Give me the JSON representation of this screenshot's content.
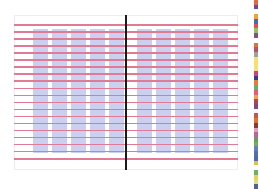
{
  "layout_grid": {
    "description": "Two-page spread layout grid with baseline rules and column guides",
    "columns_per_page": 5,
    "pages": 2,
    "baseline_rule_count": 20,
    "colors": {
      "page_background": "#ffffff",
      "page_border": "#ececf2",
      "column_guide": "#c8cdf0",
      "baseline_rule": "#e07a95",
      "spine": "#1a1a1a"
    }
  },
  "color_strip": {
    "swatches": [
      "#e06a3a",
      "#6a4aa0",
      "#ffffff",
      "#f0a040",
      "#4a6ab0",
      "#e05050",
      "#90c060",
      "#8a4a9a",
      "#ffffff",
      "#e07040",
      "#c05060",
      "#a0a0a0",
      "#f5e070",
      "#f5e070",
      "#f5e070",
      "#d04080",
      "#3a3a8a",
      "#e08030",
      "#60b070",
      "#e06070",
      "#f0a050",
      "#c04040",
      "#7a4a8a",
      "#ffffff",
      "#d05050",
      "#e07030",
      "#8a3a3a",
      "#e0a0b0",
      "#c060a0",
      "#60a060",
      "#70b050",
      "#6080c0",
      "#5070b0",
      "#4a6aa8",
      "#e0c050",
      "#ffffff",
      "#70b060",
      "#f0d050",
      "#e0e070",
      "#5060a0"
    ]
  }
}
